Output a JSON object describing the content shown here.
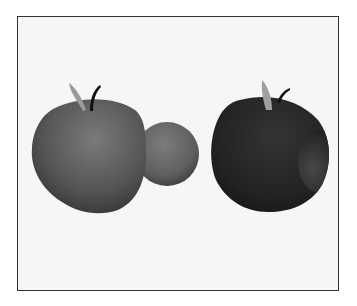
{
  "figure": {
    "background": "#f6f6f6",
    "border_color": "#333333",
    "objects": [
      {
        "name": "apple-union",
        "description": "apple body merged with a sphere on its right side",
        "body_color": "#5a5a5a",
        "sphere_color": "#6a6a6a",
        "leaf_color": "#9a9a9a",
        "stem_color": "#111111"
      },
      {
        "name": "apple-difference",
        "description": "dark apple with a spherical bite carved out on its right side",
        "body_color": "#252525",
        "cavity_color": "#3c3c3c",
        "leaf_color": "#a0a0a0",
        "stem_color": "#111111"
      }
    ]
  }
}
